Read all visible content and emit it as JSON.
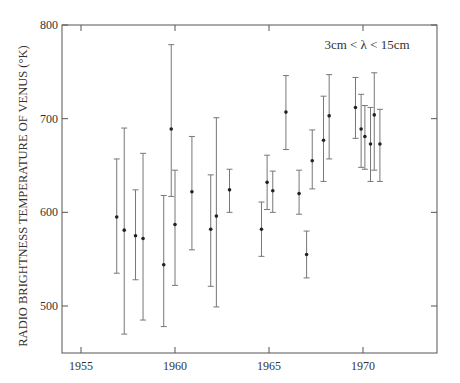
{
  "chart_data": {
    "type": "scatter",
    "subtype": "errorbar",
    "title": "",
    "annotation": "3cm < λ < 15cm",
    "xlabel": "",
    "ylabel": "RADIO BRIGHTNESS TEMPERATURE OF VENUS (°K)",
    "xlim": [
      1954.2,
      1973.9
    ],
    "ylim": [
      450,
      800
    ],
    "xticks": [
      1955,
      1960,
      1965,
      1970
    ],
    "yticks": [
      500,
      600,
      700,
      800
    ],
    "xtick_labels": [
      "1955",
      "1960",
      "1965",
      "1970"
    ],
    "ytick_labels": [
      "500",
      "600",
      "700",
      "800"
    ],
    "grid": false,
    "legend": null,
    "points": [
      {
        "x": 1956.9,
        "y": 595,
        "ymin": 535,
        "ymax": 657
      },
      {
        "x": 1957.3,
        "y": 581,
        "ymin": 470,
        "ymax": 690
      },
      {
        "x": 1957.9,
        "y": 575,
        "ymin": 528,
        "ymax": 624
      },
      {
        "x": 1958.3,
        "y": 572,
        "ymin": 485,
        "ymax": 663
      },
      {
        "x": 1959.4,
        "y": 544,
        "ymin": 478,
        "ymax": 618
      },
      {
        "x": 1959.8,
        "y": 689,
        "ymin": 617,
        "ymax": 779
      },
      {
        "x": 1960.0,
        "y": 587,
        "ymin": 522,
        "ymax": 645
      },
      {
        "x": 1960.9,
        "y": 622,
        "ymin": 560,
        "ymax": 681
      },
      {
        "x": 1961.9,
        "y": 582,
        "ymin": 521,
        "ymax": 640
      },
      {
        "x": 1962.2,
        "y": 596,
        "ymin": 499,
        "ymax": 701
      },
      {
        "x": 1962.9,
        "y": 624,
        "ymin": 600,
        "ymax": 646
      },
      {
        "x": 1964.6,
        "y": 582,
        "ymin": 553,
        "ymax": 611
      },
      {
        "x": 1964.9,
        "y": 632,
        "ymin": 603,
        "ymax": 661
      },
      {
        "x": 1965.2,
        "y": 623,
        "ymin": 600,
        "ymax": 644
      },
      {
        "x": 1965.9,
        "y": 707,
        "ymin": 667,
        "ymax": 746
      },
      {
        "x": 1966.6,
        "y": 620,
        "ymin": 598,
        "ymax": 645
      },
      {
        "x": 1967.0,
        "y": 555,
        "ymin": 530,
        "ymax": 580
      },
      {
        "x": 1967.3,
        "y": 655,
        "ymin": 625,
        "ymax": 688
      },
      {
        "x": 1967.9,
        "y": 677,
        "ymin": 633,
        "ymax": 724
      },
      {
        "x": 1968.2,
        "y": 703,
        "ymin": 657,
        "ymax": 747
      },
      {
        "x": 1969.6,
        "y": 712,
        "ymin": 679,
        "ymax": 744
      },
      {
        "x": 1969.9,
        "y": 689,
        "ymin": 648,
        "ymax": 726
      },
      {
        "x": 1970.1,
        "y": 681,
        "ymin": 646,
        "ymax": 714
      },
      {
        "x": 1970.4,
        "y": 673,
        "ymin": 633,
        "ymax": 712
      },
      {
        "x": 1970.6,
        "y": 704,
        "ymin": 645,
        "ymax": 749
      },
      {
        "x": 1970.9,
        "y": 673,
        "ymin": 633,
        "ymax": 710
      }
    ]
  },
  "colors": {
    "axis": "#555555",
    "errorbar": "#777777",
    "point": "#222222",
    "text": "#333333"
  }
}
